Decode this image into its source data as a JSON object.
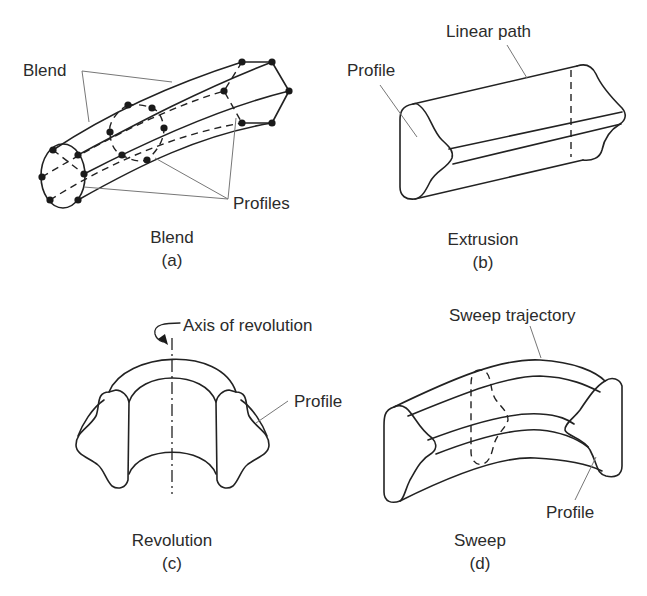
{
  "figure": {
    "panels": [
      {
        "id": "a",
        "title": "Blend",
        "letter": "(a)",
        "callouts": [
          "Blend",
          "Profiles"
        ]
      },
      {
        "id": "b",
        "title": "Extrusion",
        "letter": "(b)",
        "callouts": [
          "Linear path",
          "Profile"
        ]
      },
      {
        "id": "c",
        "title": "Revolution",
        "letter": "(c)",
        "callouts": [
          "Axis of revolution",
          "Profile"
        ]
      },
      {
        "id": "d",
        "title": "Sweep",
        "letter": "(d)",
        "callouts": [
          "Sweep trajectory",
          "Profile"
        ]
      }
    ]
  }
}
